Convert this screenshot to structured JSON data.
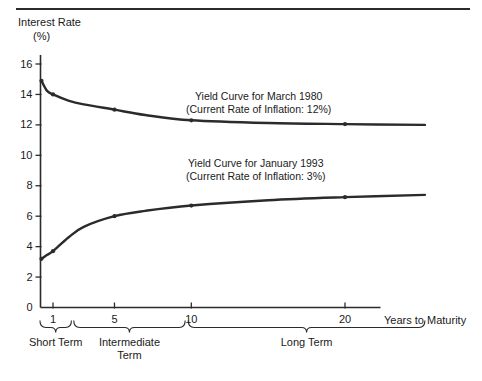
{
  "figure": {
    "top_rule": true
  },
  "chart_data": {
    "type": "line",
    "title": "",
    "subtitle": "",
    "xlabel": "Years to Maturity",
    "ylabel": "Interest Rate",
    "ylabel_unit": "(%)",
    "grid": false,
    "legend_position": "inline-annotations",
    "xlim": [
      0,
      25.5
    ],
    "ylim": [
      0,
      17
    ],
    "x_ticks": [
      1,
      5,
      10,
      20
    ],
    "x_tick_labels": [
      "1",
      "5",
      "10",
      "20"
    ],
    "y_ticks": [
      0,
      2,
      4,
      6,
      8,
      10,
      12,
      14,
      16
    ],
    "y_tick_labels": [
      "0",
      "2",
      "4",
      "6",
      "8",
      "10",
      "12",
      "14",
      "16"
    ],
    "series": [
      {
        "name": "Yield Curve for March 1980",
        "annotation_line1": "Yield Curve for March 1980",
        "annotation_line2": "(Current Rate of Inflation: 12%)",
        "inflation_rate": "12%",
        "color": "#2b2b2b",
        "x": [
          0.25,
          0.6,
          1,
          2,
          3,
          5,
          7,
          10,
          15,
          20,
          25.2
        ],
        "y": [
          14.9,
          14.25,
          14.0,
          13.6,
          13.35,
          13.0,
          12.65,
          12.3,
          12.12,
          12.05,
          12.0
        ],
        "markers": [
          {
            "x": 0.25,
            "y": 14.9
          },
          {
            "x": 1,
            "y": 14.0
          },
          {
            "x": 5,
            "y": 13.0
          },
          {
            "x": 10,
            "y": 12.3
          },
          {
            "x": 20,
            "y": 12.05
          }
        ]
      },
      {
        "name": "Yield Curve for January 1993",
        "annotation_line1": "Yield Curve for January 1993",
        "annotation_line2": "(Current Rate of Inflation: 3%)",
        "inflation_rate": "3%",
        "color": "#2b2b2b",
        "x": [
          0.25,
          0.6,
          1,
          2,
          3,
          5,
          7,
          10,
          15,
          20,
          25.2
        ],
        "y": [
          3.2,
          3.45,
          3.7,
          4.6,
          5.3,
          6.0,
          6.35,
          6.7,
          7.05,
          7.25,
          7.4
        ],
        "markers": [
          {
            "x": 0.25,
            "y": 3.2
          },
          {
            "x": 1,
            "y": 3.7
          },
          {
            "x": 5,
            "y": 6.0
          },
          {
            "x": 10,
            "y": 6.7
          },
          {
            "x": 20,
            "y": 7.25
          }
        ]
      }
    ],
    "maturity_groups": [
      {
        "label": "Short Term",
        "x_start": 0.15,
        "x_end": 2.2
      },
      {
        "label": "Intermediate\nTerm",
        "label_line1": "Intermediate",
        "label_line2": "Term",
        "x_start": 2.35,
        "x_end": 9.6
      },
      {
        "label": "Long Term",
        "x_start": 9.8,
        "x_end": 25.2
      }
    ]
  }
}
